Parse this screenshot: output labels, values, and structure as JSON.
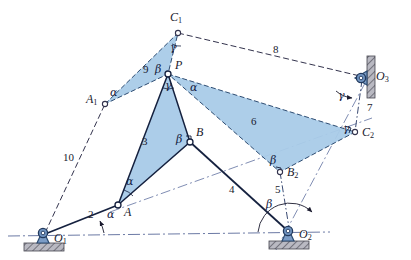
{
  "figure": {
    "colors": {
      "shade_fill": "#a9cbe8",
      "shade_edge": "#2b4a6f",
      "solid_link": "#1a1a2e",
      "dash_line": "#3a3a55",
      "dashdot_line": "#4a5a7a",
      "pivot_body": "#5b7fae",
      "ground_block": "#8a8a96",
      "axis_line": "#4a5a8a",
      "text": "#1a1a2e"
    },
    "nodes": [
      {
        "id": "O1",
        "label": "O",
        "sub": "1",
        "x": 43,
        "y": 236,
        "type": "ground-pivot"
      },
      {
        "id": "O2",
        "label": "O",
        "sub": "2",
        "x": 288,
        "y": 232,
        "type": "ground-pivot"
      },
      {
        "id": "O3",
        "label": "O",
        "sub": "3",
        "x": 362,
        "y": 78,
        "type": "wall-pivot"
      },
      {
        "id": "A",
        "label": "A",
        "sub": "",
        "x": 118,
        "y": 205,
        "type": "joint"
      },
      {
        "id": "B",
        "label": "B",
        "sub": "",
        "x": 190,
        "y": 142,
        "type": "joint"
      },
      {
        "id": "P",
        "label": "P",
        "sub": "",
        "x": 168,
        "y": 74,
        "type": "joint"
      },
      {
        "id": "A1",
        "label": "A",
        "sub": "1",
        "x": 105,
        "y": 104,
        "type": "joint"
      },
      {
        "id": "C1",
        "label": "C",
        "sub": "1",
        "x": 178,
        "y": 33,
        "type": "joint"
      },
      {
        "id": "C2",
        "label": "C",
        "sub": "2",
        "x": 355,
        "y": 132,
        "type": "joint"
      },
      {
        "id": "B2",
        "label": "B",
        "sub": "2",
        "x": 280,
        "y": 172,
        "type": "joint"
      }
    ],
    "node_labels": [
      {
        "name": "node-label-O1",
        "text": "O",
        "sub": "1",
        "x": 54,
        "y": 240
      },
      {
        "name": "node-label-O2",
        "text": "O",
        "sub": "2",
        "x": 299,
        "y": 236
      },
      {
        "name": "node-label-O3",
        "text": "O",
        "sub": "3",
        "x": 374,
        "y": 76
      },
      {
        "name": "node-label-A",
        "text": "A",
        "sub": "",
        "x": 124,
        "y": 210
      },
      {
        "name": "node-label-B",
        "text": "B",
        "sub": "",
        "x": 196,
        "y": 131
      },
      {
        "name": "node-label-P",
        "text": "P",
        "sub": "",
        "x": 174,
        "y": 63
      },
      {
        "name": "node-label-A1",
        "text": "A",
        "sub": "1",
        "x": 88,
        "y": 98
      },
      {
        "name": "node-label-C1",
        "text": "C",
        "sub": "1",
        "x": 171,
        "y": 16
      },
      {
        "name": "node-label-C2",
        "text": "C",
        "sub": "2",
        "x": 364,
        "y": 132
      },
      {
        "name": "node-label-B2",
        "text": "B",
        "sub": "2",
        "x": 287,
        "y": 171
      }
    ],
    "link_labels": [
      {
        "name": "link-label-2",
        "text": "2",
        "x": 90,
        "y": 216
      },
      {
        "name": "link-label-3",
        "text": "3",
        "x": 143,
        "y": 142
      },
      {
        "name": "link-label-4",
        "text": "4",
        "x": 231,
        "y": 190
      },
      {
        "name": "link-label-5",
        "text": "5",
        "x": 277,
        "y": 190
      },
      {
        "name": "link-label-6",
        "text": "6",
        "x": 253,
        "y": 122
      },
      {
        "name": "link-label-7",
        "text": "7",
        "x": 369,
        "y": 108
      },
      {
        "name": "link-label-8",
        "text": "8",
        "x": 275,
        "y": 50
      },
      {
        "name": "link-label-9",
        "text": "9",
        "x": 145,
        "y": 70
      },
      {
        "name": "link-label-10",
        "text": "10",
        "x": 67,
        "y": 158
      }
    ],
    "angle_labels": [
      {
        "name": "angle-alpha-at-O1",
        "text": "α",
        "x": 109,
        "y": 215
      },
      {
        "name": "angle-alpha-at-A",
        "text": "α",
        "x": 128,
        "y": 182
      },
      {
        "name": "angle-gamma-at-P",
        "text": "γ",
        "x": 167,
        "y": 86
      },
      {
        "name": "angle-beta-at-B",
        "text": "β",
        "x": 178,
        "y": 140
      },
      {
        "name": "angle-alpha-at-A1",
        "text": "α",
        "x": 112,
        "y": 93
      },
      {
        "name": "angle-gamma-at-C1",
        "text": "γ",
        "x": 172,
        "y": 48
      },
      {
        "name": "angle-beta-at-P-9",
        "text": "β",
        "x": 158,
        "y": 71
      },
      {
        "name": "angle-alpha-at-P-6",
        "text": "α",
        "x": 192,
        "y": 89
      },
      {
        "name": "angle-gamma-at-C2",
        "text": "γ",
        "x": 345,
        "y": 129
      },
      {
        "name": "angle-beta-at-B2",
        "text": "β",
        "x": 272,
        "y": 161
      },
      {
        "name": "angle-gamma-at-O3",
        "text": "γ",
        "x": 340,
        "y": 96
      },
      {
        "name": "angle-beta-at-O2",
        "text": "β",
        "x": 268,
        "y": 205
      }
    ],
    "links": [
      {
        "name": "link-2-O1-A",
        "from": "O1",
        "to": "A",
        "style": "solid",
        "number": "2"
      },
      {
        "name": "link-4-B-O2",
        "from": "B",
        "to": "O2",
        "style": "solid",
        "number": "4"
      },
      {
        "name": "link-3-triangle-APB",
        "vertices": [
          "A",
          "P",
          "B"
        ],
        "style": "solid-filled",
        "number": "3"
      },
      {
        "name": "link-9-triangle-A1-C1-P",
        "vertices": [
          "A1",
          "C1",
          "P"
        ],
        "style": "dashed-filled",
        "number": "9"
      },
      {
        "name": "link-6-triangle-P-C2-B2",
        "vertices": [
          "P",
          "C2",
          "B2"
        ],
        "style": "dashed-filled",
        "number": "6"
      },
      {
        "name": "link-10-O1-A1",
        "from": "O1",
        "to": "A1",
        "style": "dashed",
        "number": "10"
      },
      {
        "name": "link-8-C1-O3",
        "from": "C1",
        "to": "O3",
        "style": "dashed",
        "number": "8"
      },
      {
        "name": "link-7-O3-C2",
        "from": "O3",
        "to": "C2",
        "style": "dashdot",
        "number": "7"
      },
      {
        "name": "link-5-B2-O2",
        "from": "B2",
        "to": "O2",
        "style": "dashdot",
        "number": "5"
      }
    ]
  }
}
